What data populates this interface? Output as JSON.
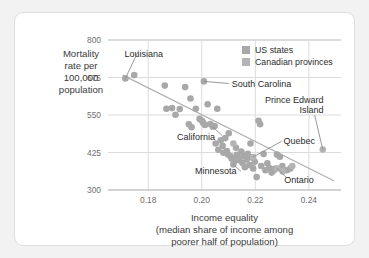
{
  "chart_data": {
    "type": "scatter",
    "title": "",
    "xlabel": "Income equality (median share of income among poorer half of population)",
    "xlabel_lines": [
      "Income equality",
      "(median share of income among",
      "poorer half of population)"
    ],
    "ylabel": "Mortality rate per 100,000 population",
    "ylabel_lines": [
      "Mortality",
      "rate per",
      "100,000",
      "population"
    ],
    "xlim": [
      0.165,
      0.252
    ],
    "ylim": [
      300,
      800
    ],
    "xticks": [
      0.18,
      0.2,
      0.22,
      0.24
    ],
    "xtick_labels": [
      "0.18",
      "0.20",
      "0.22",
      "0.24"
    ],
    "yticks": [
      300,
      425,
      550,
      675,
      800
    ],
    "ytick_labels": [
      "300",
      "425",
      "550",
      "675",
      "800"
    ],
    "grid": true,
    "legend_position": "top-right",
    "legend": [
      {
        "label": "US states",
        "color": "#a8a8a8"
      },
      {
        "label": "Canadian provinces",
        "color": "#b4b4b4"
      }
    ],
    "trendline": {
      "x": [
        0.1705,
        0.2495
      ],
      "y": [
        683,
        330
      ],
      "color": "#b0b0b0"
    },
    "series": [
      {
        "name": "US states",
        "color": "#a8a8a8",
        "points": [
          [
            0.1715,
            672
          ],
          [
            0.1748,
            683
          ],
          [
            0.1862,
            648
          ],
          [
            0.1868,
            571
          ],
          [
            0.1889,
            573
          ],
          [
            0.1902,
            551
          ],
          [
            0.1918,
            570
          ],
          [
            0.1938,
            643
          ],
          [
            0.1952,
            519
          ],
          [
            0.1958,
            605
          ],
          [
            0.1962,
            509
          ],
          [
            0.1978,
            571
          ],
          [
            0.1992,
            537
          ],
          [
            0.2001,
            531
          ],
          [
            0.2005,
            524
          ],
          [
            0.2008,
            662
          ],
          [
            0.2012,
            517
          ],
          [
            0.2022,
            586
          ],
          [
            0.2032,
            520
          ],
          [
            0.2041,
            511
          ],
          [
            0.2048,
            513
          ],
          [
            0.2052,
            455
          ],
          [
            0.2058,
            571
          ],
          [
            0.2062,
            434
          ],
          [
            0.2071,
            466
          ],
          [
            0.2078,
            447
          ],
          [
            0.2081,
            424
          ],
          [
            0.2088,
            473
          ],
          [
            0.2094,
            430
          ],
          [
            0.2098,
            418
          ],
          [
            0.2101,
            489
          ],
          [
            0.2108,
            412
          ],
          [
            0.2112,
            404
          ],
          [
            0.2118,
            385
          ],
          [
            0.2122,
            396
          ],
          [
            0.2128,
            441
          ],
          [
            0.2131,
            417
          ],
          [
            0.2138,
            408
          ],
          [
            0.2141,
            399
          ],
          [
            0.2148,
            428
          ],
          [
            0.2152,
            390
          ],
          [
            0.2158,
            413
          ],
          [
            0.2161,
            376
          ],
          [
            0.2168,
            402
          ],
          [
            0.2172,
            421
          ],
          [
            0.2178,
            383
          ],
          [
            0.2182,
            455
          ],
          [
            0.2188,
            408
          ],
          [
            0.2192,
            372
          ],
          [
            0.2198,
            394
          ],
          [
            0.2205,
            343
          ],
          [
            0.2212,
            531
          ],
          [
            0.2218,
            519
          ],
          [
            0.2222,
            380
          ],
          [
            0.2231,
            420
          ],
          [
            0.2238,
            366
          ],
          [
            0.2245,
            389
          ],
          [
            0.2252,
            373
          ],
          [
            0.2261,
            358
          ],
          [
            0.2268,
            364
          ],
          [
            0.2272,
            371
          ],
          [
            0.2281,
            418
          ],
          [
            0.2292,
            411
          ],
          [
            0.2301,
            380
          ],
          [
            0.2318,
            366
          ],
          [
            0.2331,
            372
          ]
        ]
      },
      {
        "name": "Canadian provinces",
        "color": "#b4b4b4",
        "points": [
          [
            0.2192,
            410
          ],
          [
            0.2281,
            372
          ],
          [
            0.2452,
            435
          ],
          [
            0.2118,
            455
          ],
          [
            0.2338,
            380
          ],
          [
            0.2302,
            362
          ]
        ]
      }
    ],
    "annotations": [
      {
        "label": "Louisiana",
        "text_x": 0.1712,
        "text_y": 745,
        "point_x": 0.1715,
        "point_y": 672,
        "align": "start"
      },
      {
        "label": "South Carolina",
        "text_x": 0.2112,
        "text_y": 645,
        "point_x": 0.2008,
        "point_y": 662,
        "align": "start"
      },
      {
        "label": "Prince Edward Island",
        "text_x": 0.2455,
        "text_y": 590,
        "point_x": 0.2452,
        "point_y": 435,
        "align": "end"
      },
      {
        "label": "California",
        "text_x": 0.1908,
        "text_y": 468,
        "point_x": 0.2041,
        "point_y": 511,
        "align": "start"
      },
      {
        "label": "Quebec",
        "text_x": 0.2305,
        "text_y": 452,
        "point_x": 0.2192,
        "point_y": 410,
        "align": "start"
      },
      {
        "label": "Minnesota",
        "text_x": 0.1975,
        "text_y": 352,
        "point_x": 0.2118,
        "point_y": 385,
        "align": "start"
      },
      {
        "label": "Ontario",
        "text_x": 0.2308,
        "text_y": 322,
        "point_x": 0.2281,
        "point_y": 372,
        "align": "start"
      }
    ]
  }
}
